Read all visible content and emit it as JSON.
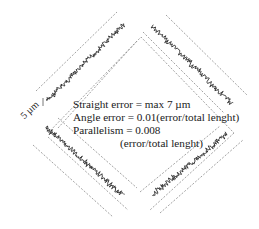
{
  "diagram": {
    "scale_bar": {
      "label": "5 µm"
    },
    "annotations": {
      "straight_error": "Straight error = max 7 µm",
      "angle_error": "Angle error = 0.01(error/total lenght)",
      "parallelism": "Parallelism = 0.008",
      "parallelism_unit": "(error/total lenght)"
    },
    "sides": [
      {
        "id": "top-left",
        "label": "profile-top-left"
      },
      {
        "id": "top-right",
        "label": "profile-top-right"
      },
      {
        "id": "bottom-left",
        "label": "profile-bottom-left"
      },
      {
        "id": "bottom-right",
        "label": "profile-bottom-right"
      }
    ],
    "colors": {
      "profile": "#2b2b2b",
      "dashed": "#8a8a8a",
      "text": "#1a1a1a"
    }
  }
}
